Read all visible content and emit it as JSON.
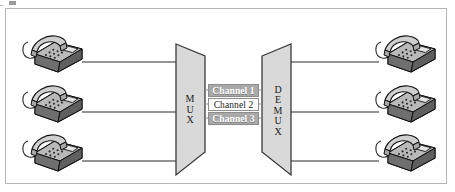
{
  "figure": {
    "background_color": "#ffffff",
    "frame_border_color": "#b5b5b5"
  },
  "devices": {
    "mux": {
      "label": "MUX",
      "letters": [
        "M",
        "U",
        "X"
      ],
      "fill": "#d9d9d9",
      "stroke": "#3b3b3b",
      "shape": "trapezoid-wide-left"
    },
    "demux": {
      "label": "DEMUX",
      "letters": [
        "D",
        "E",
        "M",
        "U",
        "X"
      ],
      "fill": "#d9d9d9",
      "stroke": "#3b3b3b",
      "shape": "trapezoid-wide-right"
    }
  },
  "channels": [
    {
      "label": "Channel 1",
      "style": "shaded",
      "fill": "#a9a9a9",
      "text_color": "#ffffff"
    },
    {
      "label": "Channel 2",
      "style": "plain",
      "fill": "#ffffff",
      "text_color": "#1a1a1a"
    },
    {
      "label": "Channel 3",
      "style": "shaded",
      "fill": "#a9a9a9",
      "text_color": "#ffffff"
    }
  ],
  "phones": {
    "icon": "telephone-icon",
    "count_left": 3,
    "count_right": 3,
    "body_color": "#8e8e8e",
    "top_color": "#c9c9c9",
    "outline_color": "#1a1a1a",
    "left": [
      {
        "name": "telephone-left-1"
      },
      {
        "name": "telephone-left-2"
      },
      {
        "name": "telephone-left-3"
      }
    ],
    "right": [
      {
        "name": "telephone-right-1"
      },
      {
        "name": "telephone-right-2"
      },
      {
        "name": "telephone-right-3"
      }
    ]
  },
  "links": {
    "line_color": "#2a2a2a",
    "left_lines": 3,
    "right_lines": 3
  }
}
